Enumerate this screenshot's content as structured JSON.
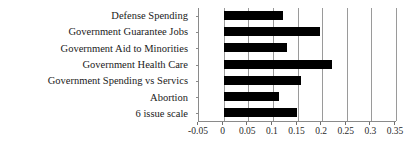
{
  "chart_data": {
    "type": "bar",
    "orientation": "horizontal",
    "title": "",
    "subtitle": "",
    "xlabel": "",
    "ylabel": "",
    "categories": [
      "Defense Spending",
      "Government Guarantee Jobs",
      "Government Aid to Minorities",
      "Government Health Care",
      "Government Spending vs Servics",
      "Abortion",
      "6 issue scale"
    ],
    "values": [
      0.12,
      0.195,
      0.128,
      0.22,
      0.157,
      0.112,
      0.148
    ],
    "series": [
      {
        "name": "",
        "values": [
          0.12,
          0.195,
          0.128,
          0.22,
          0.157,
          0.112,
          0.148
        ]
      }
    ],
    "xlim": [
      -0.05,
      0.35
    ],
    "xticks": [
      -0.05,
      0,
      0.05,
      0.1,
      0.15,
      0.2,
      0.25,
      0.3,
      0.35
    ],
    "xtick_labels": [
      "-0.05",
      "0",
      "0.05",
      "0.1",
      "0.15",
      "0.2",
      "0.25",
      "0.3",
      "0.35"
    ],
    "grid": true,
    "grid_axis": "x",
    "legend": false,
    "legend_position": "none",
    "bar_color": "#000000",
    "background_color": "#ffffff",
    "axis_color": "#8a8a8a",
    "gridline_color": "#9a9a9a",
    "annotations": []
  }
}
